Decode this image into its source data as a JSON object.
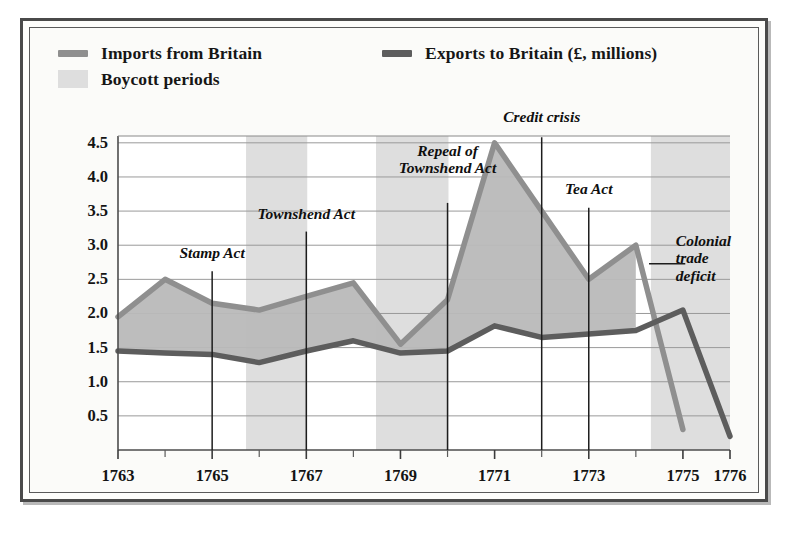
{
  "figure": {
    "frame_style": "double-ruled-box",
    "background": "#fbfbf9"
  },
  "legend": {
    "entries": [
      {
        "label": "Imports from Britain",
        "marker": "line-swatch",
        "color": "#8f8f8f"
      },
      {
        "label": "Exports to Britain (£, millions)",
        "marker": "line-swatch",
        "color": "#5d5d5d"
      },
      {
        "label": "Boycott periods",
        "marker": "box-swatch",
        "color": "#dcdcdc"
      }
    ]
  },
  "axes": {
    "y_ticks": [
      "4.5",
      "4.0",
      "3.5",
      "3.0",
      "2.5",
      "2.0",
      "1.5",
      "1.0",
      "0.5"
    ],
    "x_ticks_major": [
      "1763",
      "1765",
      "1767",
      "1769",
      "1771",
      "1773",
      "1775",
      "1776"
    ],
    "x_minor_years": [
      1764,
      1766,
      1768,
      1770,
      1772,
      1774
    ]
  },
  "chart_data": {
    "type": "area",
    "title": "",
    "subtitle": "",
    "xlabel": "",
    "ylabel": "£, millions",
    "xlim": [
      1763,
      1776
    ],
    "ylim": [
      0,
      4.6
    ],
    "ytick_values": [
      0.5,
      1.0,
      1.5,
      2.0,
      2.5,
      3.0,
      3.5,
      4.0,
      4.5
    ],
    "grid": true,
    "legend_position": "top-left",
    "x": [
      1763,
      1764,
      1765,
      1766,
      1767,
      1768,
      1769,
      1770,
      1771,
      1772,
      1773,
      1774,
      1775,
      1776
    ],
    "series": [
      {
        "name": "Imports from Britain",
        "color": "#8f8f8f",
        "values": [
          1.95,
          2.5,
          2.15,
          2.05,
          2.25,
          2.45,
          1.55,
          2.2,
          4.5,
          3.5,
          2.5,
          3.0,
          0.3,
          null
        ]
      },
      {
        "name": "Exports to Britain",
        "color": "#5d5d5d",
        "values": [
          1.45,
          1.42,
          1.4,
          1.28,
          1.45,
          1.6,
          1.42,
          1.45,
          1.82,
          1.65,
          1.7,
          1.75,
          2.05,
          0.2
        ]
      }
    ],
    "fill_between": {
      "label": "Colonial trade deficit",
      "upper": "Imports from Britain",
      "lower": "Exports to Britain",
      "color": "#b9b9b9"
    },
    "shaded_bands": {
      "label": "Boycott periods",
      "color": "#dedede",
      "spans": [
        [
          1765.72,
          1767.02
        ],
        [
          1768.48,
          1770.02
        ],
        [
          1774.32,
          1776.0
        ]
      ]
    },
    "annotations": [
      {
        "text": "Stamp Act",
        "year": 1765.0,
        "label_y": 2.78,
        "line_top": 2.62,
        "line_bottom": 0.0
      },
      {
        "text": "Townshend Act",
        "year": 1767.0,
        "label_y": 3.35,
        "line_top": 3.2,
        "line_bottom": 0.0
      },
      {
        "text": "Repeal of\nTownshend Act",
        "year": 1770.0,
        "label_y": 4.02,
        "line_top": 3.62,
        "line_bottom": 0.0
      },
      {
        "text": "Credit crisis",
        "year": 1772.0,
        "label_y": 4.78,
        "line_top": 4.58,
        "line_bottom": 0.0
      },
      {
        "text": "Tea Act",
        "year": 1773.0,
        "label_y": 3.72,
        "line_top": 3.55,
        "line_bottom": 0.0
      },
      {
        "text": "Colonial\ntrade\ndeficit",
        "year": 1774.85,
        "label_y": 3.05,
        "leader": true
      }
    ]
  }
}
